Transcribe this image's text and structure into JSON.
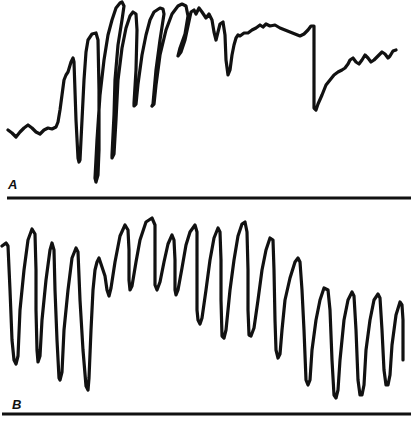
{
  "figure": {
    "panels": [
      {
        "label": "A",
        "label_pos": [
          8,
          178
        ],
        "baseline_y": 198,
        "baseline_x": [
          7,
          411
        ]
      },
      {
        "label": "B",
        "label_pos": [
          12,
          398
        ],
        "baseline_y": 414,
        "baseline_x": [
          2,
          411
        ]
      }
    ],
    "colors": {
      "ink": "#111111",
      "background": "#ffffff"
    }
  },
  "chart_data": [
    {
      "type": "line",
      "title": "A",
      "xlabel": "",
      "ylabel": "",
      "grid": false,
      "legend": null,
      "description": "Recording trace A: low baseline ripple, then a burst of large rapid oscillations that ramp up to a high plateau with small ripples, an abrupt drop near x=313, followed by a gradual wavy recovery.",
      "points": [
        [
          8,
          130
        ],
        [
          12,
          133
        ],
        [
          16,
          137
        ],
        [
          20,
          132
        ],
        [
          24,
          128
        ],
        [
          28,
          125
        ],
        [
          32,
          128
        ],
        [
          36,
          132
        ],
        [
          40,
          134
        ],
        [
          44,
          130
        ],
        [
          48,
          128
        ],
        [
          52,
          129
        ],
        [
          56,
          127
        ],
        [
          58,
          122
        ],
        [
          60,
          110
        ],
        [
          62,
          95
        ],
        [
          64,
          80
        ],
        [
          66,
          75
        ],
        [
          68,
          72
        ],
        [
          71,
          62
        ],
        [
          73,
          58
        ],
        [
          74,
          62
        ],
        [
          76,
          120
        ],
        [
          78,
          158
        ],
        [
          79,
          162
        ],
        [
          80,
          160
        ],
        [
          82,
          120
        ],
        [
          84,
          80
        ],
        [
          86,
          52
        ],
        [
          88,
          40
        ],
        [
          92,
          34
        ],
        [
          96,
          33
        ],
        [
          98,
          40
        ],
        [
          99,
          90
        ],
        [
          99,
          150
        ],
        [
          98,
          175
        ],
        [
          96,
          182
        ],
        [
          95,
          178
        ],
        [
          97,
          140
        ],
        [
          100,
          95
        ],
        [
          104,
          60
        ],
        [
          108,
          35
        ],
        [
          112,
          20
        ],
        [
          116,
          8
        ],
        [
          120,
          3
        ],
        [
          122,
          2
        ],
        [
          124,
          6
        ],
        [
          122,
          20
        ],
        [
          118,
          45
        ],
        [
          115,
          80
        ],
        [
          114,
          115
        ],
        [
          113,
          135
        ],
        [
          112,
          155
        ],
        [
          112,
          158
        ],
        [
          114,
          154
        ],
        [
          116,
          120
        ],
        [
          118,
          80
        ],
        [
          122,
          48
        ],
        [
          126,
          28
        ],
        [
          130,
          16
        ],
        [
          133,
          12
        ],
        [
          136,
          14
        ],
        [
          137,
          30
        ],
        [
          136,
          70
        ],
        [
          134,
          103
        ],
        [
          134,
          106
        ],
        [
          136,
          104
        ],
        [
          138,
          84
        ],
        [
          142,
          55
        ],
        [
          146,
          35
        ],
        [
          150,
          20
        ],
        [
          154,
          12
        ],
        [
          160,
          8
        ],
        [
          163,
          9
        ],
        [
          164,
          14
        ],
        [
          160,
          40
        ],
        [
          156,
          70
        ],
        [
          153,
          104
        ],
        [
          152,
          106
        ],
        [
          154,
          104
        ],
        [
          156,
          85
        ],
        [
          160,
          55
        ],
        [
          166,
          30
        ],
        [
          172,
          14
        ],
        [
          178,
          6
        ],
        [
          182,
          4
        ],
        [
          186,
          6
        ],
        [
          188,
          16
        ],
        [
          185,
          34
        ],
        [
          180,
          48
        ],
        [
          178,
          56
        ],
        [
          181,
          52
        ],
        [
          185,
          40
        ],
        [
          188,
          26
        ],
        [
          191,
          12
        ],
        [
          194,
          10
        ],
        [
          196,
          14
        ],
        [
          199,
          8
        ],
        [
          202,
          12
        ],
        [
          206,
          18
        ],
        [
          209,
          14
        ],
        [
          212,
          20
        ],
        [
          214,
          32
        ],
        [
          216,
          40
        ],
        [
          218,
          32
        ],
        [
          220,
          24
        ],
        [
          223,
          22
        ],
        [
          225,
          35
        ],
        [
          226,
          60
        ],
        [
          228,
          75
        ],
        [
          230,
          70
        ],
        [
          232,
          55
        ],
        [
          234,
          45
        ],
        [
          236,
          38
        ],
        [
          238,
          35
        ],
        [
          240,
          36
        ],
        [
          244,
          33
        ],
        [
          248,
          33
        ],
        [
          252,
          30
        ],
        [
          256,
          28
        ],
        [
          260,
          25
        ],
        [
          263,
          27
        ],
        [
          266,
          24
        ],
        [
          270,
          26
        ],
        [
          275,
          25
        ],
        [
          280,
          28
        ],
        [
          285,
          30
        ],
        [
          290,
          32
        ],
        [
          295,
          34
        ],
        [
          300,
          36
        ],
        [
          304,
          34
        ],
        [
          308,
          30
        ],
        [
          311,
          26
        ],
        [
          314,
          26
        ],
        [
          314,
          60
        ],
        [
          314,
          95
        ],
        [
          314,
          108
        ],
        [
          316,
          110
        ],
        [
          318,
          104
        ],
        [
          322,
          95
        ],
        [
          326,
          85
        ],
        [
          330,
          80
        ],
        [
          334,
          75
        ],
        [
          338,
          72
        ],
        [
          342,
          70
        ],
        [
          345,
          68
        ],
        [
          348,
          64
        ],
        [
          350,
          60
        ],
        [
          353,
          58
        ],
        [
          356,
          62
        ],
        [
          359,
          64
        ],
        [
          362,
          60
        ],
        [
          365,
          55
        ],
        [
          368,
          58
        ],
        [
          371,
          62
        ],
        [
          374,
          60
        ],
        [
          378,
          56
        ],
        [
          382,
          52
        ],
        [
          385,
          54
        ],
        [
          388,
          58
        ],
        [
          390,
          56
        ],
        [
          393,
          51
        ],
        [
          396,
          50
        ]
      ]
    },
    {
      "type": "line",
      "title": "B",
      "xlabel": "",
      "ylabel": "",
      "grid": false,
      "legend": null,
      "description": "Recording trace B: a continuous series of large, rhythmic, sawtooth-like oscillations (about 21 cycles) with varying trough depths; amplitude larger toward the right end.",
      "points": [
        [
          2,
          246
        ],
        [
          6,
          243
        ],
        [
          8,
          246
        ],
        [
          10,
          290
        ],
        [
          12,
          340
        ],
        [
          14,
          360
        ],
        [
          16,
          364
        ],
        [
          18,
          356
        ],
        [
          20,
          310
        ],
        [
          24,
          270
        ],
        [
          28,
          240
        ],
        [
          32,
          229
        ],
        [
          35,
          234
        ],
        [
          36,
          270
        ],
        [
          36,
          310
        ],
        [
          37,
          350
        ],
        [
          38,
          362
        ],
        [
          40,
          356
        ],
        [
          42,
          320
        ],
        [
          46,
          280
        ],
        [
          50,
          250
        ],
        [
          52,
          243
        ],
        [
          54,
          250
        ],
        [
          55,
          290
        ],
        [
          57,
          340
        ],
        [
          59,
          378
        ],
        [
          60,
          380
        ],
        [
          62,
          372
        ],
        [
          64,
          330
        ],
        [
          68,
          290
        ],
        [
          72,
          258
        ],
        [
          76,
          248
        ],
        [
          78,
          252
        ],
        [
          80,
          300
        ],
        [
          83,
          350
        ],
        [
          86,
          386
        ],
        [
          88,
          390
        ],
        [
          89,
          378
        ],
        [
          91,
          330
        ],
        [
          93,
          290
        ],
        [
          95,
          270
        ],
        [
          97,
          262
        ],
        [
          99,
          258
        ],
        [
          101,
          264
        ],
        [
          103,
          270
        ],
        [
          105,
          276
        ],
        [
          107,
          290
        ],
        [
          109,
          296
        ],
        [
          111,
          288
        ],
        [
          115,
          262
        ],
        [
          120,
          236
        ],
        [
          125,
          225
        ],
        [
          128,
          230
        ],
        [
          129,
          250
        ],
        [
          129,
          280
        ],
        [
          130,
          290
        ],
        [
          132,
          286
        ],
        [
          136,
          262
        ],
        [
          140,
          240
        ],
        [
          146,
          222
        ],
        [
          152,
          218
        ],
        [
          155,
          225
        ],
        [
          155,
          250
        ],
        [
          155,
          285
        ],
        [
          157,
          290
        ],
        [
          160,
          282
        ],
        [
          164,
          262
        ],
        [
          168,
          244
        ],
        [
          172,
          235
        ],
        [
          174,
          240
        ],
        [
          175,
          260
        ],
        [
          175,
          290
        ],
        [
          176,
          295
        ],
        [
          178,
          290
        ],
        [
          182,
          268
        ],
        [
          186,
          245
        ],
        [
          190,
          232
        ],
        [
          195,
          225
        ],
        [
          197,
          232
        ],
        [
          197,
          270
        ],
        [
          197,
          310
        ],
        [
          198,
          320
        ],
        [
          200,
          324
        ],
        [
          202,
          318
        ],
        [
          206,
          290
        ],
        [
          210,
          260
        ],
        [
          214,
          238
        ],
        [
          218,
          228
        ],
        [
          220,
          232
        ],
        [
          221,
          260
        ],
        [
          221,
          300
        ],
        [
          222,
          336
        ],
        [
          224,
          338
        ],
        [
          226,
          330
        ],
        [
          230,
          290
        ],
        [
          234,
          260
        ],
        [
          238,
          236
        ],
        [
          242,
          224
        ],
        [
          245,
          222
        ],
        [
          247,
          232
        ],
        [
          248,
          270
        ],
        [
          248,
          310
        ],
        [
          249,
          335
        ],
        [
          251,
          336
        ],
        [
          254,
          328
        ],
        [
          258,
          300
        ],
        [
          262,
          270
        ],
        [
          266,
          250
        ],
        [
          270,
          238
        ],
        [
          273,
          240
        ],
        [
          274,
          270
        ],
        [
          275,
          320
        ],
        [
          276,
          350
        ],
        [
          278,
          358
        ],
        [
          280,
          354
        ],
        [
          282,
          330
        ],
        [
          285,
          300
        ],
        [
          290,
          278
        ],
        [
          295,
          262
        ],
        [
          298,
          258
        ],
        [
          300,
          262
        ],
        [
          302,
          290
        ],
        [
          304,
          330
        ],
        [
          306,
          380
        ],
        [
          308,
          385
        ],
        [
          310,
          380
        ],
        [
          312,
          350
        ],
        [
          316,
          320
        ],
        [
          320,
          300
        ],
        [
          324,
          288
        ],
        [
          328,
          290
        ],
        [
          330,
          310
        ],
        [
          332,
          360
        ],
        [
          334,
          395
        ],
        [
          336,
          398
        ],
        [
          338,
          390
        ],
        [
          340,
          360
        ],
        [
          344,
          320
        ],
        [
          348,
          300
        ],
        [
          352,
          292
        ],
        [
          354,
          296
        ],
        [
          356,
          330
        ],
        [
          358,
          380
        ],
        [
          360,
          395
        ],
        [
          362,
          395
        ],
        [
          364,
          385
        ],
        [
          366,
          350
        ],
        [
          370,
          320
        ],
        [
          374,
          300
        ],
        [
          378,
          294
        ],
        [
          380,
          298
        ],
        [
          382,
          330
        ],
        [
          384,
          370
        ],
        [
          386,
          385
        ],
        [
          388,
          385
        ],
        [
          390,
          375
        ],
        [
          392,
          345
        ],
        [
          396,
          315
        ],
        [
          400,
          302
        ],
        [
          402,
          305
        ],
        [
          403,
          320
        ],
        [
          403,
          345
        ],
        [
          403,
          360
        ]
      ]
    }
  ]
}
